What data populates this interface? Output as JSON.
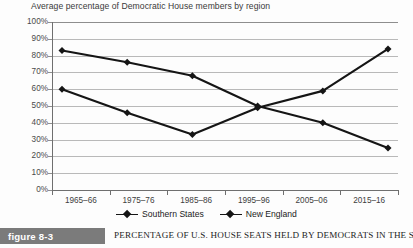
{
  "chart_data": {
    "type": "line",
    "title": "Average percentage of Democratic House members by region",
    "xlabel": "",
    "ylabel": "",
    "ylim": [
      0,
      100
    ],
    "grid": true,
    "legend_position": "bottom",
    "categories": [
      "1965–66",
      "1975–76",
      "1985–86",
      "1995–96",
      "2005–06",
      "2015–16"
    ],
    "ytick_labels": [
      "100%",
      "90%",
      "80%",
      "70%",
      "60%",
      "50%",
      "40%",
      "30%",
      "20%",
      "10%",
      "0%"
    ],
    "ytick_values": [
      100,
      90,
      80,
      70,
      60,
      50,
      40,
      30,
      20,
      10,
      0
    ],
    "series": [
      {
        "name": "Southern States",
        "color": "#151515",
        "marker": "diamond",
        "values": [
          83,
          76,
          68,
          50,
          40,
          25
        ]
      },
      {
        "name": "New England",
        "color": "#151515",
        "marker": "diamond",
        "values": [
          60,
          46,
          33,
          49,
          59,
          84
        ]
      }
    ]
  },
  "caption": {
    "badge": "figure 8-3",
    "text": "Percentage of U.S. House Seats Held by Democrats in the South and"
  }
}
